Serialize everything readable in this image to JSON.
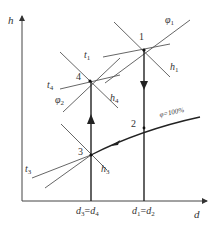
{
  "axes": {
    "y_label": "h",
    "x_label": "d"
  },
  "points": [
    {
      "id": "1",
      "label": "1"
    },
    {
      "id": "2",
      "label": "2"
    },
    {
      "id": "3",
      "label": "3"
    },
    {
      "id": "4",
      "label": "4"
    }
  ],
  "isolines": {
    "t1": {
      "sym": "t",
      "sub": "1"
    },
    "phi1": {
      "sym": "φ",
      "sub": "1"
    },
    "h1": {
      "sym": "h",
      "sub": "1"
    },
    "t4": {
      "sym": "t",
      "sub": "4"
    },
    "phi2": {
      "sym": "φ",
      "sub": "2"
    },
    "h4": {
      "sym": "h",
      "sub": "4"
    },
    "t3": {
      "sym": "t",
      "sub": "3"
    },
    "h3": {
      "sym": "h",
      "sub": "3"
    },
    "saturation": "φ=100%"
  },
  "x_ticks": [
    {
      "left": {
        "sym": "d",
        "sub": "3"
      },
      "eq": "=",
      "right": {
        "sym": "d",
        "sub": "4"
      }
    },
    {
      "left": {
        "sym": "d",
        "sub": "1"
      },
      "eq": "=",
      "right": {
        "sym": "d",
        "sub": "2"
      }
    }
  ],
  "colors": {
    "line": "#333333",
    "background": "#ffffff"
  }
}
